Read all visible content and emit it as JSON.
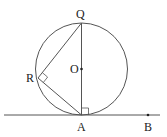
{
  "diagram": {
    "type": "geometry",
    "labels": {
      "Q": "Q",
      "O": "O",
      "R": "R",
      "A": "A",
      "B": "B"
    },
    "points": {
      "Q": [
        81,
        23
      ],
      "O": [
        81,
        69
      ],
      "R": [
        38,
        78
      ],
      "A": [
        81,
        115
      ],
      "B": [
        148,
        115
      ]
    },
    "circle": {
      "center": "O",
      "radius": 46
    },
    "right_angles": [
      "QRA",
      "QAB"
    ],
    "colors": {
      "stroke": "#555555",
      "text": "#222222"
    }
  }
}
